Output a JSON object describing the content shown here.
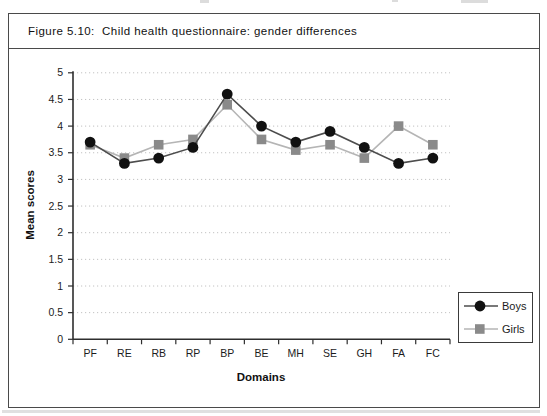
{
  "page": {
    "figure_title": "Figure 5.10:  Child health questionnaire: gender differences"
  },
  "chart_data": {
    "type": "line",
    "title": "Figure 5.10: Child health questionnaire: gender differences",
    "categories": [
      "PF",
      "RE",
      "RB",
      "RP",
      "BP",
      "BE",
      "MH",
      "SE",
      "GH",
      "FA",
      "FC"
    ],
    "series": [
      {
        "name": "Boys",
        "marker": "circle",
        "marker_color": "#111111",
        "line_color": "#4d4d4d",
        "values": [
          3.7,
          3.3,
          3.4,
          3.6,
          4.6,
          4.0,
          3.7,
          3.9,
          3.6,
          3.3,
          3.4
        ]
      },
      {
        "name": "Girls",
        "marker": "square",
        "marker_color": "#8a8a8a",
        "line_color": "#b5b5b5",
        "values": [
          3.65,
          3.4,
          3.65,
          3.75,
          4.4,
          3.75,
          3.55,
          3.65,
          3.4,
          4.0,
          3.65
        ]
      }
    ],
    "xlabel": "Domains",
    "ylabel": "Mean scores",
    "ylim": [
      0,
      5
    ],
    "yticks": [
      0,
      0.5,
      1,
      1.5,
      2,
      2.5,
      3,
      3.5,
      4,
      4.5,
      5
    ],
    "grid": "horizontal-dotted",
    "gridline_color": "#c2c2c2",
    "axis_color": "#2e2e2e",
    "legend_position": "bottom-right",
    "legend_entries": [
      "Boys",
      "Girls"
    ]
  }
}
